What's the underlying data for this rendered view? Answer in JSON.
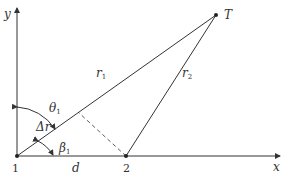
{
  "diagram": {
    "axes": {
      "x_label": "x",
      "y_label": "y"
    },
    "points": {
      "p1": {
        "label": "1"
      },
      "p2": {
        "label": "2"
      },
      "target": {
        "label": "T"
      }
    },
    "segments": {
      "r1": {
        "label": "r",
        "sub": "1"
      },
      "r2": {
        "label": "r",
        "sub": "2"
      },
      "baseline": {
        "label": "d"
      }
    },
    "angles": {
      "theta1": {
        "label": "θ",
        "sub": "1"
      },
      "beta1": {
        "label": "β",
        "sub": "1"
      },
      "delta_r": {
        "label": "Δr"
      }
    },
    "colors": {
      "stroke": "#333333"
    }
  }
}
